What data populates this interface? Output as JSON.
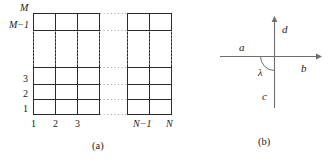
{
  "figure": {
    "background_color": "#ffffff",
    "ink_color": "#2b2b2b",
    "faint_ink_color": "#9a9a9a"
  },
  "panel_a": {
    "caption": "(a)",
    "description": "rectangular lattice grid of M rows by N columns with ellipsis gaps",
    "y_axis_labels": [
      "M",
      "M−1",
      "3",
      "2",
      "1"
    ],
    "x_axis_labels": [
      "1",
      "2",
      "3",
      "N−1",
      "N"
    ],
    "rows_total_symbol": "M",
    "columns_total_symbol": "N",
    "ellipsis_glyph": "···"
  },
  "panel_b": {
    "caption": "(b)",
    "description": "orthogonal axis cross with four branch labels and an angle arc",
    "axis_labels": {
      "left": "a",
      "right": "b",
      "top": "d",
      "bottom": "c"
    },
    "angle_label": "λ",
    "arrow_directions": [
      "right",
      "up"
    ]
  }
}
